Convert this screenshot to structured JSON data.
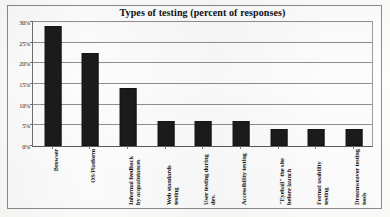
{
  "figure": {
    "title": "Types of testing (percent of responses)",
    "frame_color": "#8d8d8d",
    "bar_color": "#1b1b1b",
    "grid_color": "#8f8f8f"
  },
  "chart_data": {
    "type": "bar",
    "title": "Types of testing (percent of responses)",
    "xlabel": "",
    "ylabel": "",
    "ylim": [
      0,
      30
    ],
    "ytick_labels": [
      "0%",
      "5%",
      "10%",
      "15%",
      "20%",
      "25%",
      "30%"
    ],
    "ytick_values": [
      0,
      5,
      10,
      15,
      20,
      25,
      30
    ],
    "grid": true,
    "legend": false,
    "orientation": "vertical",
    "categories": [
      "Browser",
      "OS/Platform",
      "Informal feedback by acquaintances",
      "Web standards testing",
      "User testing during dev.",
      "Accessibility testing",
      "\"Eyeball\" the site before launch",
      "Formal usability testing",
      "Dreamweaver testing tools"
    ],
    "values": [
      29,
      22.5,
      14,
      6,
      6,
      6,
      4,
      4,
      4
    ],
    "value_unit": "percent"
  }
}
